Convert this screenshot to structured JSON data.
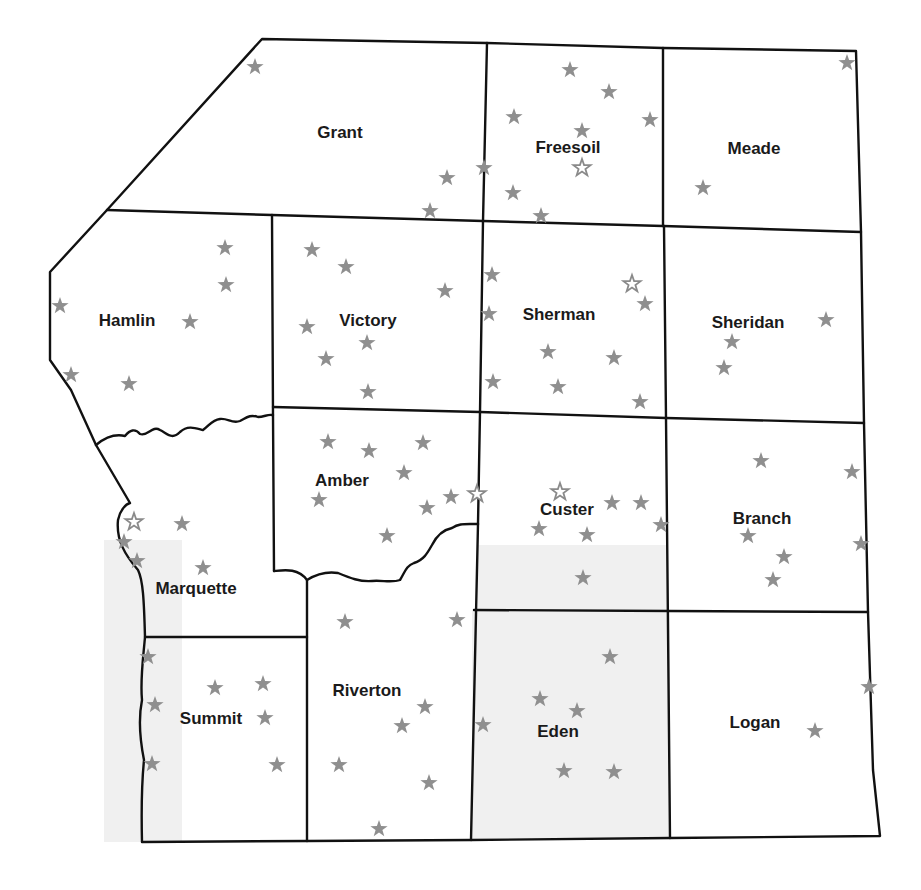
{
  "map": {
    "colors": {
      "border": "#111111",
      "background": "#ffffff",
      "shaded_area": "#f0f0f0",
      "star_solid": "#8f8f8f",
      "star_open_outline": "#8a8a8a"
    },
    "counties": [
      {
        "name": "Grant",
        "x": 340,
        "y": 138
      },
      {
        "name": "Freesoil",
        "x": 568,
        "y": 153
      },
      {
        "name": "Meade",
        "x": 754,
        "y": 154
      },
      {
        "name": "Hamlin",
        "x": 127,
        "y": 326
      },
      {
        "name": "Victory",
        "x": 368,
        "y": 326
      },
      {
        "name": "Sherman",
        "x": 559,
        "y": 320
      },
      {
        "name": "Sheridan",
        "x": 748,
        "y": 328
      },
      {
        "name": "Amber",
        "x": 342,
        "y": 486
      },
      {
        "name": "Custer",
        "x": 567,
        "y": 515
      },
      {
        "name": "Branch",
        "x": 762,
        "y": 524
      },
      {
        "name": "Marquette",
        "x": 196,
        "y": 594
      },
      {
        "name": "Summit",
        "x": 211,
        "y": 724
      },
      {
        "name": "Riverton",
        "x": 367,
        "y": 696
      },
      {
        "name": "Eden",
        "x": 558,
        "y": 737
      },
      {
        "name": "Logan",
        "x": 755,
        "y": 728
      }
    ],
    "stars_solid": [
      [
        255,
        67
      ],
      [
        447,
        178
      ],
      [
        430,
        211
      ],
      [
        484,
        168
      ],
      [
        570,
        70
      ],
      [
        609,
        92
      ],
      [
        514,
        117
      ],
      [
        650,
        120
      ],
      [
        582,
        131
      ],
      [
        513,
        193
      ],
      [
        541,
        216
      ],
      [
        847,
        63
      ],
      [
        703,
        188
      ],
      [
        225,
        248
      ],
      [
        226,
        285
      ],
      [
        190,
        322
      ],
      [
        60,
        306
      ],
      [
        71,
        375
      ],
      [
        129,
        384
      ],
      [
        312,
        250
      ],
      [
        346,
        267
      ],
      [
        445,
        291
      ],
      [
        307,
        327
      ],
      [
        367,
        343
      ],
      [
        326,
        359
      ],
      [
        368,
        392
      ],
      [
        492,
        275
      ],
      [
        489,
        314
      ],
      [
        645,
        304
      ],
      [
        548,
        352
      ],
      [
        614,
        358
      ],
      [
        493,
        382
      ],
      [
        558,
        387
      ],
      [
        640,
        402
      ],
      [
        826,
        320
      ],
      [
        732,
        342
      ],
      [
        724,
        368
      ],
      [
        328,
        442
      ],
      [
        369,
        451
      ],
      [
        423,
        443
      ],
      [
        404,
        473
      ],
      [
        319,
        500
      ],
      [
        451,
        497
      ],
      [
        427,
        508
      ],
      [
        387,
        536
      ],
      [
        612,
        503
      ],
      [
        641,
        503
      ],
      [
        661,
        525
      ],
      [
        539,
        529
      ],
      [
        587,
        535
      ],
      [
        583,
        578
      ],
      [
        761,
        461
      ],
      [
        852,
        472
      ],
      [
        748,
        536
      ],
      [
        784,
        557
      ],
      [
        773,
        580
      ],
      [
        861,
        544
      ],
      [
        182,
        524
      ],
      [
        124,
        542
      ],
      [
        137,
        561
      ],
      [
        203,
        568
      ],
      [
        345,
        622
      ],
      [
        457,
        620
      ],
      [
        148,
        657
      ],
      [
        155,
        705
      ],
      [
        215,
        688
      ],
      [
        263,
        684
      ],
      [
        265,
        718
      ],
      [
        152,
        764
      ],
      [
        277,
        765
      ],
      [
        425,
        707
      ],
      [
        402,
        726
      ],
      [
        339,
        765
      ],
      [
        429,
        783
      ],
      [
        379,
        829
      ],
      [
        483,
        725
      ],
      [
        610,
        657
      ],
      [
        540,
        699
      ],
      [
        577,
        711
      ],
      [
        564,
        771
      ],
      [
        614,
        772
      ],
      [
        869,
        687
      ],
      [
        815,
        731
      ]
    ],
    "stars_open": [
      [
        582,
        168
      ],
      [
        632,
        284
      ],
      [
        477,
        494
      ],
      [
        560,
        492
      ],
      [
        134,
        522
      ]
    ]
  }
}
